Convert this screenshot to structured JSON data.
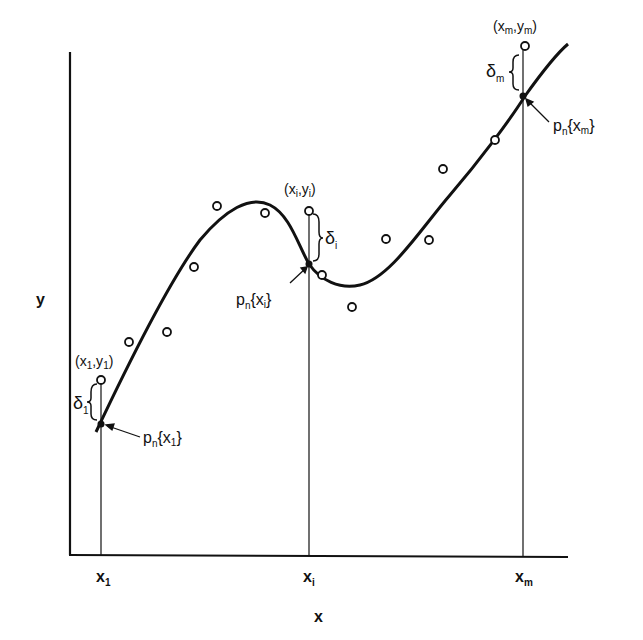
{
  "diagram": {
    "type": "least-squares polynomial fit illustration",
    "axes": {
      "x_label": "x",
      "y_label": "y",
      "x_ticks": [
        {
          "base": "x",
          "sub": "1"
        },
        {
          "base": "x",
          "sub": "i"
        },
        {
          "base": "x",
          "sub": "m"
        }
      ]
    },
    "annotations": {
      "first_point": {
        "open": "(x",
        "sub1": "1",
        "mid": ",y",
        "sub2": "1",
        "close": ")"
      },
      "middle_point": {
        "open": "(x",
        "sub1": "i",
        "mid": ",y",
        "sub2": "i",
        "close": ")"
      },
      "last_point": {
        "open": "(x",
        "sub1": "m",
        "mid": ",y",
        "sub2": "m",
        "close": ")"
      },
      "delta_first": {
        "base": "δ",
        "sub": "1"
      },
      "delta_middle": {
        "base": "δ",
        "sub": "i"
      },
      "delta_last": {
        "base": "δ",
        "sub": "m"
      },
      "poly_first": {
        "p": "p",
        "n": "n",
        "x": "x",
        "sub": "1"
      },
      "poly_middle": {
        "p": "p",
        "n": "n",
        "x": "x",
        "sub": "i"
      },
      "poly_last": {
        "p": "p",
        "n": "n",
        "x": "x",
        "sub": "m"
      }
    },
    "data_points_px": [
      [
        101,
        380
      ],
      [
        129,
        342
      ],
      [
        167,
        332
      ],
      [
        194,
        267
      ],
      [
        217,
        206
      ],
      [
        265,
        213
      ],
      [
        309,
        211
      ],
      [
        322,
        275
      ],
      [
        352,
        307
      ],
      [
        386,
        239
      ],
      [
        429,
        240
      ],
      [
        443,
        169
      ],
      [
        495,
        140
      ],
      [
        525,
        46
      ]
    ],
    "colors": {
      "ink": "#111111",
      "background": "#ffffff"
    }
  }
}
